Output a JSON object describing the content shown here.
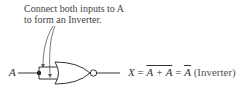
{
  "annotation": {
    "line1": "Connect both inputs to A",
    "line2": "to form an Inverter."
  },
  "input_label": "A",
  "equation": {
    "lhs": "X",
    "eq1": " = ",
    "expr": "A + A",
    "eq2": " = ",
    "result": "A",
    "note": " (Inverter)"
  },
  "gate": {
    "type": "NOR",
    "inputs_tied": true,
    "stroke_color": "#333333"
  }
}
